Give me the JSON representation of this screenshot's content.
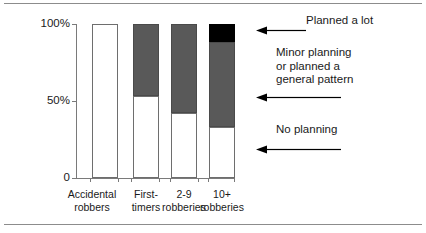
{
  "chart_data": {
    "type": "bar",
    "subtype": "stacked-100-percent",
    "title": "",
    "xlabel": "",
    "ylabel": "",
    "ylim": [
      0,
      100
    ],
    "ytick_labels": [
      "0",
      "50%",
      "100%"
    ],
    "ytick_values": [
      0,
      50,
      100
    ],
    "grid": false,
    "legend_position": "right-annotations",
    "categories": [
      "Accidental robbers",
      "First-timers",
      "2-9 robberies",
      "10+ robberies"
    ],
    "series": [
      {
        "name": "No planning",
        "color": "#ffffff",
        "values": [
          100,
          53,
          42,
          33
        ]
      },
      {
        "name": "Minor planning or planned a general pattern",
        "color": "#595959",
        "values": [
          0,
          47,
          58,
          55
        ]
      },
      {
        "name": "Planned a lot",
        "color": "#000000",
        "values": [
          0,
          0,
          0,
          12
        ]
      }
    ],
    "annotations": [
      "Planned a lot",
      "Minor planning\nor planned a\ngeneral pattern",
      "No planning"
    ]
  },
  "axis": {
    "y": {
      "tick_100": "100%",
      "tick_50": "50%",
      "tick_0": "0"
    }
  },
  "categories": {
    "c0_line1": "Accidental",
    "c0_line2": "robbers",
    "c1_line1": "First-",
    "c1_line2": "timers",
    "c2_line1": "2-9",
    "c2_line2": "robberies",
    "c3_line1": "10+",
    "c3_line2": "robberies"
  },
  "annotations": {
    "planned_a_lot": "Planned a lot",
    "minor_planning": "Minor planning\nor planned a\ngeneral pattern",
    "no_planning": "No planning"
  }
}
